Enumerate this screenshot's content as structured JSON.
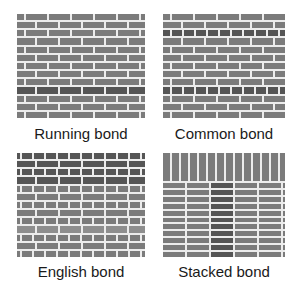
{
  "figure": {
    "panels": [
      {
        "id": "running",
        "label": "Running bond",
        "box": {
          "x": 17,
          "y": 14,
          "w": 128,
          "h": 104
        },
        "label_pos": {
          "x": 81,
          "y": 125
        },
        "type": "running",
        "courses": 13,
        "brick_len": 21,
        "dark_rows": [
          9
        ],
        "light_rows": []
      },
      {
        "id": "common",
        "label": "Common bond",
        "box": {
          "x": 163,
          "y": 14,
          "w": 122,
          "h": 104
        },
        "label_pos": {
          "x": 224,
          "y": 125
        },
        "type": "common",
        "courses": 13,
        "brick_len": 21,
        "header_len": 10,
        "header_rows": [
          2,
          9
        ],
        "dark_rows": [
          2,
          9
        ],
        "light_rows": []
      },
      {
        "id": "english",
        "label": "English bond",
        "box": {
          "x": 17,
          "y": 153,
          "w": 128,
          "h": 104
        },
        "label_pos": {
          "x": 81,
          "y": 263
        },
        "type": "english",
        "courses": 13,
        "brick_len": 21,
        "header_len": 10,
        "dark_rows": [
          0,
          1,
          2,
          3
        ],
        "light_rows": [
          9
        ]
      },
      {
        "id": "stacked",
        "label": "Stacked bond",
        "box": {
          "x": 163,
          "y": 153,
          "w": 122,
          "h": 104
        },
        "label_pos": {
          "x": 224,
          "y": 263
        },
        "type": "stacked",
        "soldier_height": 28,
        "soldier_width": 7,
        "courses": 11,
        "col_widths": [
          22,
          22,
          22,
          22,
          22,
          12
        ],
        "dark_col": 2
      }
    ],
    "colors": {
      "brick": "#7b7b7b",
      "brick_dark": "#555555",
      "brick_light": "#8e8e8e",
      "mortar": "#ececec",
      "label": "#1a1a1a"
    }
  }
}
